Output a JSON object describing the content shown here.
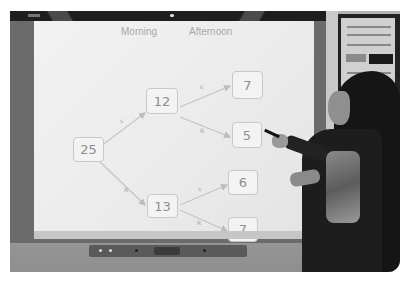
{
  "scene": {
    "description": "Teacher pointing at an interactive whiteboard displaying a weather tree diagram",
    "colors": {
      "screen": "#ececec",
      "frame": "#6b6b6b",
      "topbar": "#1e1e1e",
      "node_border": "#c8c8c8",
      "text": "#8e8e8e"
    }
  },
  "board": {
    "headers": {
      "morning": "Morning",
      "afternoon": "Afternoon"
    },
    "tree": {
      "root": {
        "value": "25"
      },
      "level1": [
        {
          "value": "12",
          "edge_label": "s"
        },
        {
          "value": "13",
          "edge_label": "R"
        }
      ],
      "level2": [
        {
          "value": "7",
          "edge_label": "s"
        },
        {
          "value": "5",
          "edge_label": "R"
        },
        {
          "value": "6",
          "edge_label": "s"
        },
        {
          "value": "7",
          "edge_label": "R"
        }
      ]
    }
  }
}
